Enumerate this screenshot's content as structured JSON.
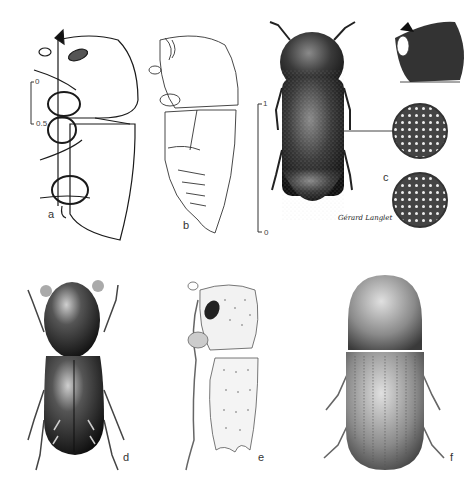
{
  "figure": {
    "panels": [
      {
        "id": "a",
        "label": "a",
        "description": "lateral outline view of beetle with legs, shaded eye"
      },
      {
        "id": "b",
        "label": "b",
        "description": "lateral outline view of beetle, abdomen segments"
      },
      {
        "id": "c",
        "label": "c",
        "description": "dorsal stippled habitus with head profile inset and two circular elytral detail magnifications"
      },
      {
        "id": "d",
        "label": "d",
        "description": "dorsal habitus, dark glossy beetle"
      },
      {
        "id": "e",
        "label": "e",
        "description": "lateral view, punctate elytra with declivity spines"
      },
      {
        "id": "f",
        "label": "f",
        "description": "dorsal habitus, striate elytra"
      }
    ],
    "scale_bars": [
      {
        "panel": "a",
        "top_label": "0",
        "bottom_label": "0.5"
      },
      {
        "panel": "c",
        "top_label": "1",
        "bottom_label": "0"
      }
    ],
    "signature": "Gérard Langlet"
  },
  "colors": {
    "ink": "#1a1a1a",
    "dark_fill": "#2a2a2a",
    "mid_fill": "#555555",
    "light_fill": "#9a9a9a",
    "paper": "#ffffff"
  }
}
